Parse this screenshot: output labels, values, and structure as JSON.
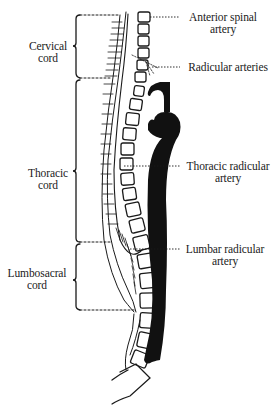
{
  "diagram": {
    "region_labels": [
      {
        "id": "cervical",
        "line1": "Cervical",
        "line2": "cord"
      },
      {
        "id": "thoracic",
        "line1": "Thoracic",
        "line2": "cord"
      },
      {
        "id": "lumbosacral",
        "line1": "Lumbosacral",
        "line2": "cord"
      }
    ],
    "artery_labels": [
      {
        "id": "anterior-spinal",
        "line1": "Anterior spinal",
        "line2": "artery"
      },
      {
        "id": "radicular",
        "line1": "Radicular arteries",
        "line2": ""
      },
      {
        "id": "thoracic-radicular",
        "line1": "Thoracic radicular",
        "line2": "artery"
      },
      {
        "id": "lumbar-radicular",
        "line1": "Lumbar radicular",
        "line2": "artery"
      }
    ],
    "colors": {
      "ink": "#1a1a1a",
      "background": "#ffffff"
    }
  }
}
